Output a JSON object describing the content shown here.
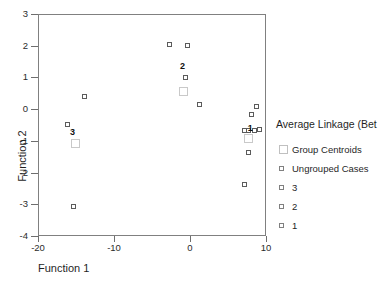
{
  "chart_data": {
    "type": "scatter",
    "title": "Average Linkage (Bet",
    "xlabel": "Function 1",
    "ylabel": "Function 2",
    "xlim": [
      -20,
      10
    ],
    "ylim": [
      -4,
      3
    ],
    "xticks": [
      "-20",
      "-10",
      "0",
      "10"
    ],
    "xtick_values": [
      -20,
      -10,
      0,
      10
    ],
    "yticks": [
      "3",
      "2",
      "1",
      "0",
      "-1",
      "-2",
      "-3",
      "-4"
    ],
    "ytick_values": [
      3,
      2,
      1,
      0,
      -1,
      -2,
      -3,
      -4
    ],
    "grid": false,
    "legend_position": "right",
    "legend": [
      {
        "label": "Group Centroids",
        "marker": "large-open-square"
      },
      {
        "label": "Ungrouped Cases",
        "marker": "small-open-square"
      },
      {
        "label": "3",
        "marker": "small-open-square"
      },
      {
        "label": "2",
        "marker": "small-open-square"
      },
      {
        "label": "1",
        "marker": "small-open-square"
      }
    ],
    "series": [
      {
        "name": "Ungrouped Cases",
        "marker": "small-open-square",
        "points": [
          {
            "x": -14.0,
            "y": 0.42
          },
          {
            "x": 1.1,
            "y": 0.17
          },
          {
            "x": 7.0,
            "y": -2.35
          },
          {
            "x": -15.5,
            "y": -3.05
          }
        ]
      },
      {
        "name": "3",
        "marker": "small-open-square",
        "points": [
          {
            "x": -16.3,
            "y": -0.45
          }
        ]
      },
      {
        "name": "2",
        "marker": "small-open-square",
        "points": [
          {
            "x": -2.8,
            "y": 2.08
          },
          {
            "x": -0.5,
            "y": 2.03
          },
          {
            "x": -0.7,
            "y": 1.02
          }
        ]
      },
      {
        "name": "1",
        "marker": "small-open-square",
        "points": [
          {
            "x": 8.6,
            "y": 0.13
          },
          {
            "x": 8.0,
            "y": -0.14
          },
          {
            "x": 7.0,
            "y": -0.63
          },
          {
            "x": 7.6,
            "y": -0.63
          },
          {
            "x": 8.3,
            "y": -0.65
          },
          {
            "x": 9.0,
            "y": -0.62
          },
          {
            "x": 7.5,
            "y": -1.32
          }
        ]
      },
      {
        "name": "Group Centroids",
        "marker": "large-open-square",
        "points": [
          {
            "x": -15.2,
            "y": -1.05,
            "cluster": "3"
          },
          {
            "x": -1.0,
            "y": 0.58,
            "cluster": "2"
          },
          {
            "x": 7.6,
            "y": -0.9,
            "cluster": "1"
          }
        ]
      }
    ],
    "cluster_labels": [
      {
        "text": "3",
        "x": -15.6,
        "y": -0.7
      },
      {
        "text": "2",
        "x": -1.1,
        "y": 1.4
      },
      {
        "text": "1",
        "x": 7.8,
        "y": -0.57
      }
    ]
  }
}
